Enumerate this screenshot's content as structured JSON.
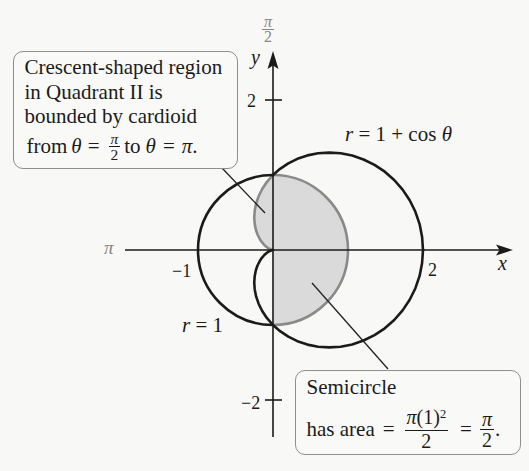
{
  "colors": {
    "bg": "#f8f8f7",
    "ink": "#1b1b1b",
    "shade": "#dadada",
    "shade-edge": "#8a8a8a",
    "box-border": "#8e8e8e",
    "label-gray": "#858585"
  },
  "axes": {
    "x_label": "x",
    "y_label": "y",
    "polar_top": {
      "num": "π",
      "den": "2"
    },
    "polar_left": "π",
    "ticks": {
      "y_pos": "2",
      "y_neg": "−2",
      "x_neg": "−1",
      "x_pos": "2"
    }
  },
  "curves": {
    "cardioid": {
      "var": "r",
      "text": " = 1 + cos ",
      "theta": "θ"
    },
    "circle": {
      "var": "r",
      "text": " = 1"
    }
  },
  "callout_crescent": {
    "lines": [
      "Crescent-shaped region",
      "in Quadrant II is",
      "bounded by cardioid"
    ],
    "last_line": {
      "from": "from",
      "theta1": "θ",
      "eq1": "=",
      "frac": {
        "num": "π",
        "den": "2"
      },
      "to": "to",
      "theta2": "θ",
      "eq2": "=",
      "pi": "π",
      "period": "."
    }
  },
  "callout_semicircle": {
    "title": "Semicircle",
    "formula": {
      "prefix": "has area",
      "eq1": "=",
      "frac1": {
        "num_pi": "π",
        "num_paren": "(1)",
        "num_exp": "2",
        "den": "2"
      },
      "eq2": "=",
      "frac2": {
        "num": "π",
        "den": "2"
      },
      "period": "."
    }
  }
}
